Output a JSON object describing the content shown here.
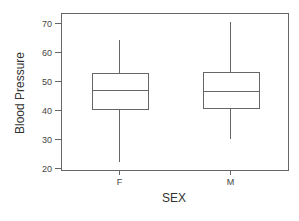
{
  "chart_data": {
    "type": "box",
    "title": "",
    "xlabel": "SEX",
    "ylabel": "Blood Pressure",
    "categories": [
      "F",
      "M"
    ],
    "ylim": [
      19,
      73
    ],
    "yticks": [
      20,
      30,
      40,
      50,
      60,
      70
    ],
    "grid": false,
    "legend": null,
    "series": [
      {
        "name": "F",
        "whisker_low": 22,
        "q1": 40.2,
        "median": 46.8,
        "q3": 52.8,
        "whisker_high": 64
      },
      {
        "name": "M",
        "whisker_low": 30,
        "q1": 40.6,
        "median": 46.6,
        "q3": 53,
        "whisker_high": 70.5
      }
    ]
  },
  "style": {
    "line_color": "#666666",
    "text_color": "#444444"
  }
}
